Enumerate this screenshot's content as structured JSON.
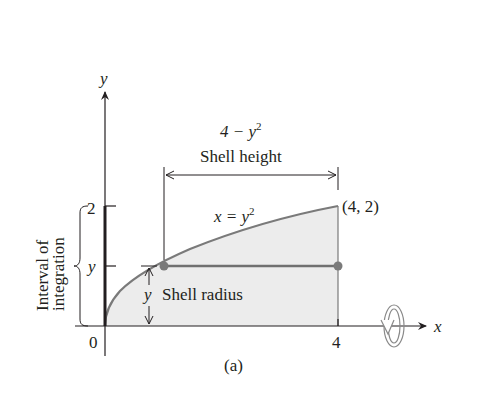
{
  "figure": {
    "caption": "(a)",
    "axes": {
      "x_label": "x",
      "y_label": "y",
      "origin_label": "0",
      "x_tick_label": "4",
      "y_tick_top_label": "2",
      "y_tick_mid_label": "y"
    },
    "curve": {
      "equation_lhs": "x = y",
      "equation_exp": "2",
      "endpoint_label": "(4, 2)"
    },
    "shell_height": {
      "expression_base": "4 − y",
      "expression_exp": "2",
      "label": "Shell height"
    },
    "shell_radius": {
      "variable": "y",
      "label": "Shell radius"
    },
    "interval": {
      "line1": "Interval of",
      "line2": "integration"
    },
    "rotation_icon": "rotation-about-x-axis-icon",
    "colors": {
      "ink": "#231f20",
      "curve": "#7a7a7a",
      "shaded_region": "#ececec",
      "shell_line": "#707070"
    }
  }
}
